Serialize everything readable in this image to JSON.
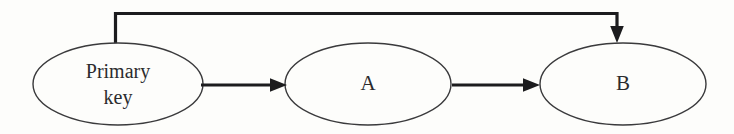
{
  "diagram": {
    "type": "directed-graph",
    "background_color": "#fdfdfb",
    "stroke_color": "#1c1c1e",
    "ellipse_stroke_color": "#3a3a3c",
    "text_color": "#2b2b2d",
    "nodes": [
      {
        "id": "primary-key",
        "label_line1": "Primary",
        "label_line2": "key",
        "shape": "ellipse",
        "cx": 118,
        "cy": 84,
        "rx": 85,
        "ry": 41
      },
      {
        "id": "a",
        "label_line1": "A",
        "label_line2": "",
        "shape": "ellipse",
        "cx": 368,
        "cy": 84,
        "rx": 83,
        "ry": 41
      },
      {
        "id": "b",
        "label_line1": "B",
        "label_line2": "",
        "shape": "ellipse",
        "cx": 623,
        "cy": 84,
        "rx": 83,
        "ry": 41
      }
    ],
    "edges": [
      {
        "id": "edge-primarykey-to-a",
        "from": "primary-key",
        "to": "a",
        "routing": "straight",
        "label": ""
      },
      {
        "id": "edge-a-to-b",
        "from": "a",
        "to": "b",
        "routing": "straight",
        "label": ""
      },
      {
        "id": "edge-primarykey-to-b",
        "from": "primary-key",
        "to": "b",
        "routing": "orthogonal-top",
        "label": ""
      }
    ]
  }
}
